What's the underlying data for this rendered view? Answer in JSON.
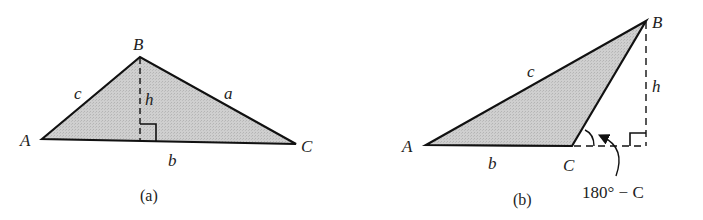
{
  "figure_a": {
    "caption": "(a)",
    "vertices": {
      "A": "A",
      "B": "B",
      "C": "C"
    },
    "sides": {
      "a": "a",
      "b": "b",
      "c": "c"
    },
    "height_label": "h"
  },
  "figure_b": {
    "caption": "(b)",
    "vertices": {
      "A": "A",
      "B": "B",
      "C": "C"
    },
    "sides": {
      "b": "b",
      "c": "c"
    },
    "height_label": "h",
    "angle_label": "180° − C"
  },
  "colors": {
    "fill": "#c8c8c8",
    "stroke": "#111111",
    "text": "#222222"
  }
}
